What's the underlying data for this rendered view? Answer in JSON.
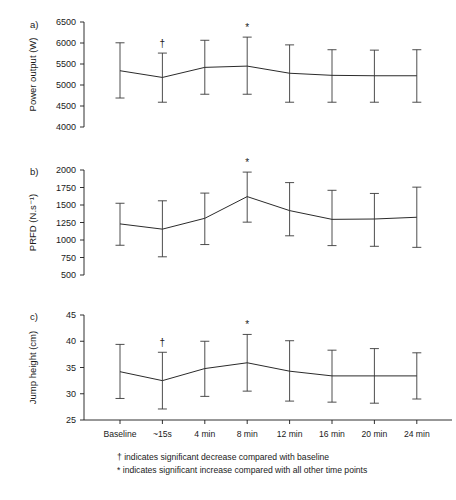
{
  "figure": {
    "footnotes": [
      "† indicates significant decrease compared with baseline",
      "* indicates significant increase compared with all other time points"
    ],
    "x_categories": [
      "Baseline",
      "~15s",
      "4 min",
      "8 min",
      "12 min",
      "16 min",
      "20 min",
      "24 min"
    ],
    "line_color": "#2b2b2b",
    "errorbar_color": "#3a3a3a",
    "axis_color": "#1a1a1a",
    "background_color": "#ffffff"
  },
  "panels": [
    {
      "letter": "a)",
      "ylabel": "Power output (W)",
      "yticks": [
        "4000",
        "4500",
        "5000",
        "5500",
        "6000",
        "6500"
      ],
      "markers": [
        {
          "category": "~15s",
          "symbol": "†"
        },
        {
          "category": "8 min",
          "symbol": "*"
        }
      ]
    },
    {
      "letter": "b)",
      "ylabel": "PRFD (N.s⁻¹)",
      "yticks": [
        "500",
        "750",
        "1000",
        "1250",
        "1500",
        "1750",
        "2000"
      ],
      "markers": [
        {
          "category": "8 min",
          "symbol": "*"
        }
      ]
    },
    {
      "letter": "c)",
      "ylabel": "Jump height (cm)",
      "yticks": [
        "25",
        "30",
        "35",
        "40",
        "45"
      ],
      "markers": [
        {
          "category": "~15s",
          "symbol": "†"
        },
        {
          "category": "8 min",
          "symbol": "*"
        }
      ]
    }
  ],
  "chart_data": [
    {
      "type": "line",
      "panel": "a",
      "title": "",
      "xlabel": "",
      "ylabel": "Power output (W)",
      "categories": [
        "Baseline",
        "~15s",
        "4 min",
        "8 min",
        "12 min",
        "16 min",
        "20 min",
        "24 min"
      ],
      "values": [
        5340,
        5180,
        5420,
        5450,
        5280,
        5230,
        5220,
        5220
      ],
      "error_upper": [
        6005,
        5760,
        6065,
        6140,
        5955,
        5840,
        5830,
        5840
      ],
      "error_lower": [
        4690,
        4590,
        4780,
        4780,
        4590,
        4590,
        4590,
        4590
      ],
      "ylim": [
        4000,
        6500
      ],
      "yticks": [
        4000,
        4500,
        5000,
        5500,
        6000,
        6500
      ],
      "grid": false,
      "legend": "none",
      "annotations": [
        {
          "category": "~15s",
          "symbol": "†"
        },
        {
          "category": "8 min",
          "symbol": "*"
        }
      ]
    },
    {
      "type": "line",
      "panel": "b",
      "title": "",
      "xlabel": "",
      "ylabel": "PRFD (N.s⁻¹)",
      "categories": [
        "Baseline",
        "~15s",
        "4 min",
        "8 min",
        "12 min",
        "16 min",
        "20 min",
        "24 min"
      ],
      "values": [
        1230,
        1155,
        1310,
        1620,
        1420,
        1295,
        1300,
        1325
      ],
      "error_upper": [
        1525,
        1560,
        1670,
        1970,
        1820,
        1710,
        1665,
        1755
      ],
      "error_lower": [
        925,
        760,
        935,
        1255,
        1060,
        920,
        910,
        895
      ],
      "ylim": [
        500,
        2000
      ],
      "yticks": [
        500,
        750,
        1000,
        1250,
        1500,
        1750,
        2000
      ],
      "grid": false,
      "legend": "none",
      "annotations": [
        {
          "category": "8 min",
          "symbol": "*"
        }
      ]
    },
    {
      "type": "line",
      "panel": "c",
      "title": "",
      "xlabel": "",
      "ylabel": "Jump height (cm)",
      "categories": [
        "Baseline",
        "~15s",
        "4 min",
        "8 min",
        "12 min",
        "16 min",
        "20 min",
        "24 min"
      ],
      "values": [
        34.2,
        32.5,
        34.8,
        35.9,
        34.3,
        33.4,
        33.4,
        33.4
      ],
      "error_upper": [
        39.4,
        37.9,
        40.0,
        41.3,
        40.1,
        38.3,
        38.6,
        37.8
      ],
      "error_lower": [
        29.1,
        27.1,
        29.5,
        30.5,
        28.6,
        28.4,
        28.2,
        29.0
      ],
      "ylim": [
        25,
        45
      ],
      "yticks": [
        25,
        30,
        35,
        40,
        45
      ],
      "grid": false,
      "legend": "none",
      "annotations": [
        {
          "category": "~15s",
          "symbol": "†"
        },
        {
          "category": "8 min",
          "symbol": "*"
        }
      ]
    }
  ]
}
